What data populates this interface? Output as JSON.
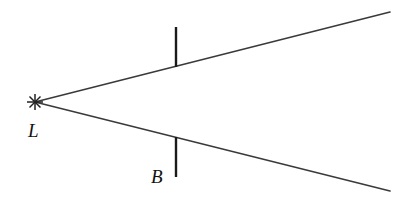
{
  "figure": {
    "labels": {
      "source": "L",
      "barrier": "B"
    },
    "colors": {
      "ray": "#3a3a3a",
      "barrier": "#1a1a1a",
      "background": "#ffffff"
    }
  }
}
